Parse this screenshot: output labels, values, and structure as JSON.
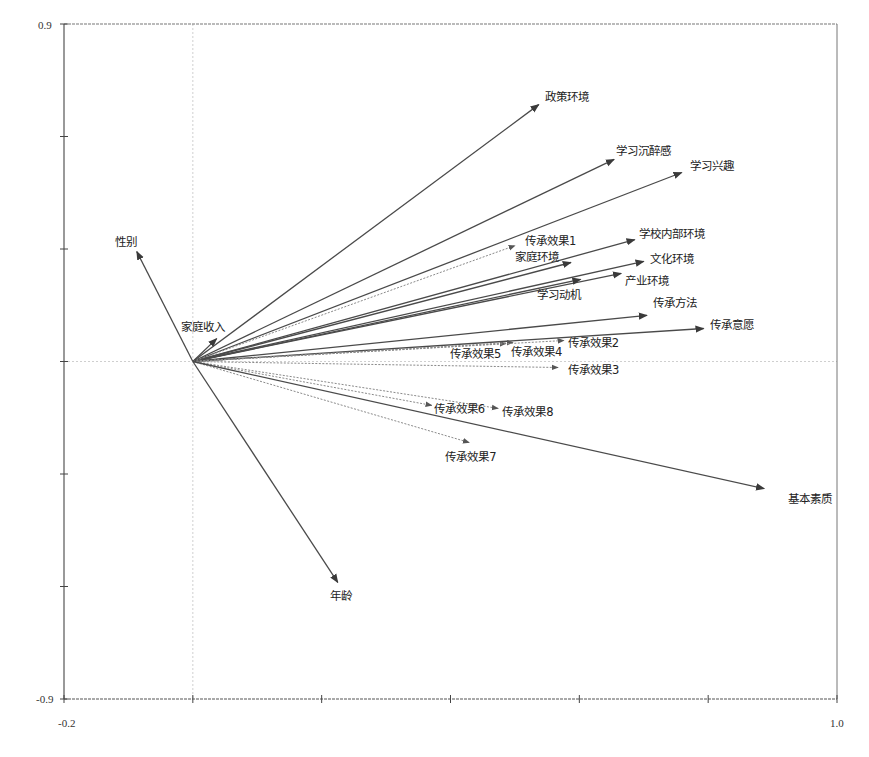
{
  "chart_data": {
    "type": "biplot",
    "title": "",
    "xlabel": "",
    "ylabel": "",
    "xlim": [
      -0.2,
      1.0
    ],
    "ylim": [
      -0.9,
      0.9
    ],
    "x_tick_labels_shown": [
      "-0.2",
      "1.0"
    ],
    "y_tick_labels_shown": [
      "0.9",
      "-0.9"
    ],
    "x_ticks": [
      -0.2,
      0.0,
      0.2,
      0.4,
      0.6,
      0.8,
      1.0
    ],
    "y_ticks": [
      0.9,
      0.6,
      0.3,
      0.0,
      -0.3,
      -0.6,
      -0.9
    ],
    "zero_lines": true,
    "arrows": [
      {
        "name": "性别",
        "x": -0.087,
        "y": 0.293,
        "style": "solid",
        "label_dx": -22,
        "label_dy": -6
      },
      {
        "name": "家庭收入",
        "x": 0.037,
        "y": 0.061,
        "style": "solid",
        "label_dx": -36,
        "label_dy": -8
      },
      {
        "name": "政策环境",
        "x": 0.537,
        "y": 0.685,
        "style": "solid",
        "label_dx": 6,
        "label_dy": -4
      },
      {
        "name": "学习沉醉感",
        "x": 0.654,
        "y": 0.539,
        "style": "solid",
        "label_dx": 2,
        "label_dy": -4
      },
      {
        "name": "学习兴趣",
        "x": 0.759,
        "y": 0.504,
        "style": "solid",
        "label_dx": 8,
        "label_dy": -3
      },
      {
        "name": "学校内部环境",
        "x": 0.686,
        "y": 0.325,
        "style": "solid",
        "label_dx": 4,
        "label_dy": -2
      },
      {
        "name": "文化环境",
        "x": 0.7,
        "y": 0.267,
        "style": "solid",
        "label_dx": 6,
        "label_dy": 2
      },
      {
        "name": "产业环境",
        "x": 0.665,
        "y": 0.235,
        "style": "solid",
        "label_dx": 4,
        "label_dy": 12
      },
      {
        "name": "学习动机",
        "x": 0.602,
        "y": 0.219,
        "style": "solid",
        "label_dx": -44,
        "label_dy": 20
      },
      {
        "name": "家庭环境",
        "x": 0.587,
        "y": 0.264,
        "style": "solid",
        "label_dx": -56,
        "label_dy": -2
      },
      {
        "name": "传承效果1",
        "x": 0.5,
        "y": 0.309,
        "style": "dotted",
        "label_dx": 10,
        "label_dy": -1
      },
      {
        "name": "传承方法",
        "x": 0.705,
        "y": 0.123,
        "style": "solid",
        "label_dx": 6,
        "label_dy": -8
      },
      {
        "name": "传承意愿",
        "x": 0.793,
        "y": 0.088,
        "style": "solid",
        "label_dx": 6,
        "label_dy": 0
      },
      {
        "name": "传承效果5",
        "x": 0.486,
        "y": 0.048,
        "style": "dotted",
        "label_dx": -56,
        "label_dy": 14
      },
      {
        "name": "传承效果4",
        "x": 0.497,
        "y": 0.051,
        "style": "dotted",
        "label_dx": -2,
        "label_dy": 14
      },
      {
        "name": "传承效果2",
        "x": 0.576,
        "y": 0.056,
        "style": "dotted",
        "label_dx": 4,
        "label_dy": 6
      },
      {
        "name": "传承效果3",
        "x": 0.567,
        "y": -0.016,
        "style": "dotted",
        "label_dx": 10,
        "label_dy": 6
      },
      {
        "name": "传承效果6",
        "x": 0.371,
        "y": -0.117,
        "style": "dotted",
        "label_dx": 2,
        "label_dy": 8
      },
      {
        "name": "传承效果8",
        "x": 0.474,
        "y": -0.125,
        "style": "dotted",
        "label_dx": 4,
        "label_dy": 8
      },
      {
        "name": "传承效果7",
        "x": 0.429,
        "y": -0.216,
        "style": "dotted",
        "label_dx": -24,
        "label_dy": 18
      },
      {
        "name": "基本素质",
        "x": 0.887,
        "y": -0.339,
        "style": "solid",
        "label_dx": 24,
        "label_dy": 14
      },
      {
        "name": "年龄",
        "x": 0.225,
        "y": -0.589,
        "style": "solid",
        "label_dx": -8,
        "label_dy": 18
      }
    ]
  },
  "axes": {
    "x_min_label": "-0.2",
    "x_max_label": "1.0",
    "y_max_label": "0.9",
    "y_min_label": "-0.9"
  },
  "colors": {
    "axis": "#555555",
    "solid_arrow": "#4a4a4a",
    "dotted_arrow": "#8a8a8a",
    "zero_line": "#cfcfcf",
    "text": "#222222"
  }
}
